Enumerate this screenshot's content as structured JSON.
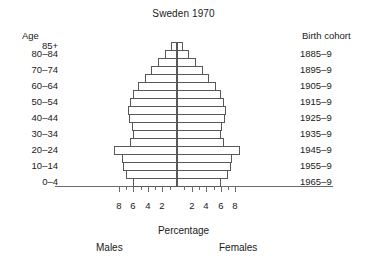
{
  "chart_data": {
    "type": "bar",
    "subtype": "population-pyramid",
    "title": "Sweden 1970",
    "xlabel": "Percentage",
    "ylabel": "Age",
    "right_axis_label": "Birth cohort",
    "left_series_name": "Males",
    "right_series_name": "Females",
    "grid": false,
    "legend": "none",
    "xlim": [
      -9,
      9
    ],
    "xticks_labeled": [
      "8",
      "6",
      "4",
      "2",
      "2",
      "4",
      "6",
      "8"
    ],
    "xtick_values": [
      -8,
      -6,
      -4,
      -2,
      2,
      4,
      6,
      8
    ],
    "xtick_minor_values": [
      -8,
      -7,
      -6,
      -5,
      -4,
      -3,
      -2,
      -1,
      1,
      2,
      3,
      4,
      5,
      6,
      7,
      8
    ],
    "age_axis_labels": [
      "85+",
      "80–84",
      "70–74",
      "60–64",
      "50–54",
      "40–44",
      "30–34",
      "20–24",
      "10–14",
      "0–4"
    ],
    "birth_cohort_labels": [
      "1885–9",
      "1895–9",
      "1905–9",
      "1915–9",
      "1925–9",
      "1935–9",
      "1945–9",
      "1955–9",
      "1965–9"
    ],
    "categories": [
      "0–4",
      "5–9",
      "10–14",
      "15–19",
      "20–24",
      "25–29",
      "30–34",
      "35–39",
      "40–44",
      "45–49",
      "50–54",
      "55–59",
      "60–64",
      "65–69",
      "70–74",
      "75–79",
      "80–84",
      "85+"
    ],
    "series": [
      {
        "name": "Males",
        "values": [
          6.0,
          7.0,
          7.4,
          7.6,
          8.6,
          6.5,
          6.0,
          6.1,
          6.6,
          6.7,
          6.5,
          6.0,
          5.3,
          4.4,
          3.5,
          2.6,
          1.6,
          0.8
        ]
      },
      {
        "name": "Females",
        "values": [
          6.0,
          7.0,
          7.4,
          7.6,
          8.6,
          6.5,
          6.0,
          6.1,
          6.6,
          6.7,
          6.5,
          6.0,
          5.3,
          4.4,
          3.5,
          2.6,
          1.6,
          0.8
        ]
      }
    ]
  }
}
